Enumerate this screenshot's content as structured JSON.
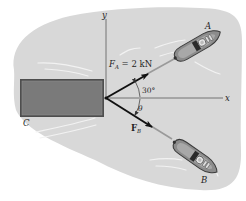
{
  "diagram": {
    "type": "statics-force-diagram",
    "colors": {
      "background": "#ffffff",
      "water": "#d8d8d8",
      "barge_fill": "#7a7a7a",
      "barge_border": "#4e4e4e",
      "axes": "#6a6a6a",
      "force_vectors": "#111111",
      "ropes": "#9a9a9a",
      "boat_hull": "#8c8c8c"
    },
    "axes": {
      "x_label": "x",
      "y_label": "y"
    },
    "objects": {
      "barge_label": "C",
      "tugboat_a_label": "A",
      "tugboat_b_label": "B"
    },
    "forces": {
      "fa_symbol": "F",
      "fa_subscript": "A",
      "fa_value": " = 2 kN",
      "fb_symbol": "F",
      "fb_subscript": "B"
    },
    "angles": {
      "fa_angle": "30°",
      "fb_angle": "θ"
    }
  }
}
